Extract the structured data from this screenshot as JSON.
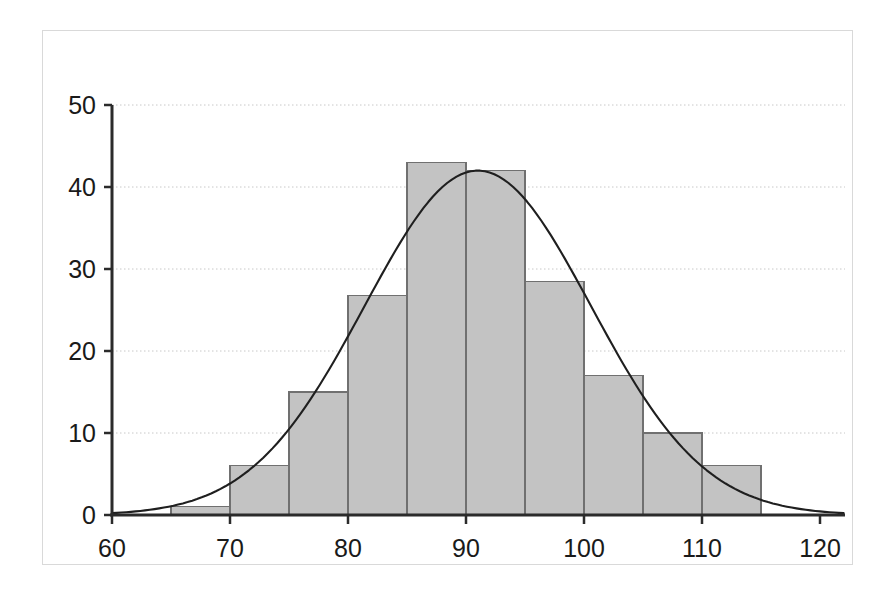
{
  "chart_data": {
    "type": "bar",
    "title": "",
    "subtitle": "",
    "xlabel": "",
    "ylabel": "",
    "xlim": [
      60,
      122
    ],
    "ylim": [
      0,
      50
    ],
    "grid": true,
    "legend": null,
    "bin_width": 5,
    "bin_edges": [
      60,
      65,
      70,
      75,
      80,
      85,
      90,
      95,
      100,
      105,
      110,
      115
    ],
    "categories": [
      "60-65",
      "65-70",
      "70-75",
      "75-80",
      "80-85",
      "85-90",
      "90-95",
      "95-100",
      "100-105",
      "105-110",
      "110-115"
    ],
    "values": [
      0,
      1,
      6,
      15,
      26.8,
      43,
      42,
      28.5,
      17,
      10,
      6
    ],
    "xticks": [
      60,
      70,
      80,
      90,
      100,
      110,
      120
    ],
    "xtick_labels": [
      "60",
      "70",
      "80",
      "90",
      "100",
      "110",
      "120"
    ],
    "yticks": [
      0,
      10,
      20,
      30,
      40,
      50
    ],
    "ytick_labels": [
      "0",
      "10",
      "20",
      "30",
      "40",
      "50"
    ],
    "series": [
      {
        "name": "histogram",
        "type": "bar",
        "values": [
          0,
          1,
          6,
          15,
          26.8,
          43,
          42,
          28.5,
          17,
          10,
          6
        ]
      },
      {
        "name": "normal-curve",
        "type": "line",
        "peak_x": 91,
        "peak_y": 42,
        "mean": 91,
        "sigma": 9.6,
        "amplitude": 42
      }
    ]
  },
  "style": {
    "bar_fill": "#c3c3c3",
    "bar_stroke": "#707070",
    "curve_color": "#1f1f1f",
    "axis_color": "#2b2b2b",
    "grid_color": "#c8c8c8",
    "frame_color": "#d9d9d9",
    "background": "#ffffff",
    "tick_text_color": "#1a1a1a"
  }
}
